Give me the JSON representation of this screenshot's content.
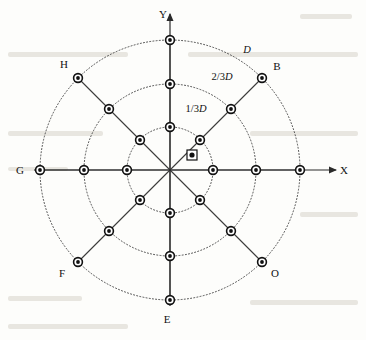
{
  "figure": {
    "type": "radial-node-diagram",
    "center": {
      "x": 170,
      "y": 170
    },
    "radii": {
      "inner": 43,
      "middle": 86,
      "outer": 130
    }
  },
  "axes": {
    "x_label": "X",
    "y_label": "Y"
  },
  "ring_labels": [
    {
      "id": "ring-inner",
      "num": "1/3",
      "sym": "D",
      "x": 196,
      "y": 112
    },
    {
      "id": "ring-middle",
      "num": "2/3",
      "sym": "D",
      "x": 222,
      "y": 80
    },
    {
      "id": "ring-outer",
      "num": "",
      "sym": "D",
      "x": 247,
      "y": 53
    }
  ],
  "point_labels": [
    {
      "id": "label-b",
      "text": "B",
      "x": 277,
      "y": 70
    },
    {
      "id": "label-o",
      "text": "O",
      "x": 275,
      "y": 277
    },
    {
      "id": "label-e",
      "text": "E",
      "x": 167,
      "y": 323
    },
    {
      "id": "label-f",
      "text": "F",
      "x": 62,
      "y": 277
    },
    {
      "id": "label-g",
      "text": "G",
      "x": 20,
      "y": 174
    },
    {
      "id": "label-h",
      "text": "H",
      "x": 64,
      "y": 68
    }
  ],
  "spokes": [
    {
      "id": "spoke-n",
      "angle_deg": 90,
      "label": ""
    },
    {
      "id": "spoke-ne",
      "angle_deg": 45,
      "label": "B"
    },
    {
      "id": "spoke-e",
      "angle_deg": 0,
      "label": ""
    },
    {
      "id": "spoke-se",
      "angle_deg": -45,
      "label": "O"
    },
    {
      "id": "spoke-s",
      "angle_deg": -90,
      "label": "E"
    },
    {
      "id": "spoke-sw",
      "angle_deg": -135,
      "label": "F"
    },
    {
      "id": "spoke-w",
      "angle_deg": 180,
      "label": "G"
    },
    {
      "id": "spoke-nw",
      "angle_deg": 135,
      "label": "H"
    }
  ],
  "nodes": [
    {
      "spoke": "spoke-n",
      "ring": "inner",
      "x": 170,
      "y": 127
    },
    {
      "spoke": "spoke-n",
      "ring": "middle",
      "x": 170,
      "y": 84
    },
    {
      "spoke": "spoke-n",
      "ring": "outer",
      "x": 170,
      "y": 40
    },
    {
      "spoke": "spoke-ne",
      "ring": "inner",
      "x": 200,
      "y": 140
    },
    {
      "spoke": "spoke-ne",
      "ring": "middle",
      "x": 231,
      "y": 109
    },
    {
      "spoke": "spoke-ne",
      "ring": "outer",
      "x": 262,
      "y": 78
    },
    {
      "spoke": "spoke-e",
      "ring": "inner",
      "x": 213,
      "y": 170
    },
    {
      "spoke": "spoke-e",
      "ring": "middle",
      "x": 256,
      "y": 170
    },
    {
      "spoke": "spoke-e",
      "ring": "outer",
      "x": 300,
      "y": 170
    },
    {
      "spoke": "spoke-se",
      "ring": "inner",
      "x": 200,
      "y": 200
    },
    {
      "spoke": "spoke-se",
      "ring": "middle",
      "x": 231,
      "y": 231
    },
    {
      "spoke": "spoke-se",
      "ring": "outer",
      "x": 262,
      "y": 262
    },
    {
      "spoke": "spoke-s",
      "ring": "inner",
      "x": 170,
      "y": 213
    },
    {
      "spoke": "spoke-s",
      "ring": "middle",
      "x": 170,
      "y": 256
    },
    {
      "spoke": "spoke-s",
      "ring": "outer",
      "x": 170,
      "y": 300
    },
    {
      "spoke": "spoke-sw",
      "ring": "inner",
      "x": 140,
      "y": 200
    },
    {
      "spoke": "spoke-sw",
      "ring": "middle",
      "x": 109,
      "y": 231
    },
    {
      "spoke": "spoke-sw",
      "ring": "outer",
      "x": 78,
      "y": 262
    },
    {
      "spoke": "spoke-w",
      "ring": "inner",
      "x": 127,
      "y": 170
    },
    {
      "spoke": "spoke-w",
      "ring": "middle",
      "x": 84,
      "y": 170
    },
    {
      "spoke": "spoke-w",
      "ring": "outer",
      "x": 40,
      "y": 170
    },
    {
      "spoke": "spoke-nw",
      "ring": "inner",
      "x": 140,
      "y": 140
    },
    {
      "spoke": "spoke-nw",
      "ring": "middle",
      "x": 109,
      "y": 109
    },
    {
      "spoke": "spoke-nw",
      "ring": "outer",
      "x": 78,
      "y": 78
    }
  ],
  "center_marker": {
    "id": "center-marker",
    "x": 192,
    "y": 155
  },
  "colors": {
    "background": "#fdfdfb",
    "ring_stroke": "#4a4a4a",
    "spoke_stroke": "#3a3a3a",
    "axis_stroke": "#2a2a2a",
    "node_fill": "#ffffff",
    "node_stroke": "#111111",
    "text": "#111111"
  }
}
